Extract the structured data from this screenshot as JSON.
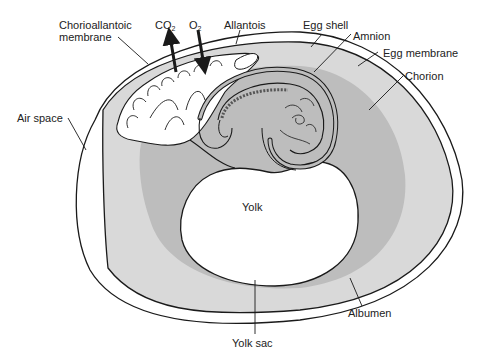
{
  "colors": {
    "outline": "#1a1a1a",
    "albumen": "#d9d9d9",
    "chorion_region": "#bdbdbd",
    "embryo_fill": "#ffffff",
    "background": "#ffffff",
    "shell_gap": "#ffffff"
  },
  "labels": {
    "chorioallantoic_1": "Chorioallantoic",
    "chorioallantoic_2": "membrane",
    "co2": "CO",
    "co2_sub": "2",
    "o2": "O",
    "o2_sub": "2",
    "allantois": "Allantois",
    "egg_shell": "Egg shell",
    "amnion": "Amnion",
    "egg_membrane": "Egg membrane",
    "chorion": "Chorion",
    "air_space": "Air space",
    "yolk": "Yolk",
    "albumen": "Albumen",
    "yolk_sac": "Yolk sac"
  },
  "arrows": [
    {
      "name": "co2-arrow",
      "direction": "up"
    },
    {
      "name": "o2-arrow",
      "direction": "down"
    }
  ]
}
